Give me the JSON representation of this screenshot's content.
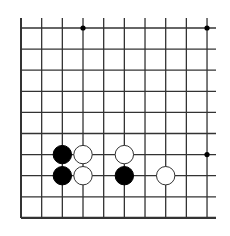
{
  "board": {
    "description": "Go board corner fragment (bottom-left edge visible, top and right open)",
    "columns": 10,
    "rows": 10,
    "origin_x": 21,
    "origin_y": 28,
    "spacing_x": 20.67,
    "spacing_y": 21.1,
    "line_color": "#333333",
    "edge_lines": [
      "left",
      "bottom"
    ],
    "star_points": [
      {
        "col": 3,
        "row": 0
      },
      {
        "col": 9,
        "row": 0
      },
      {
        "col": 9,
        "row": 6
      }
    ],
    "stones": [
      {
        "color": "black",
        "col": 2,
        "row": 6
      },
      {
        "color": "black",
        "col": 2,
        "row": 7
      },
      {
        "color": "white",
        "col": 3,
        "row": 6
      },
      {
        "color": "white",
        "col": 3,
        "row": 7
      },
      {
        "color": "white",
        "col": 5,
        "row": 6
      },
      {
        "color": "black",
        "col": 5,
        "row": 7
      },
      {
        "color": "white",
        "col": 7,
        "row": 7
      }
    ],
    "colors": {
      "black_stone": "#000000",
      "white_stone_fill": "#ffffff",
      "white_stone_stroke": "#333333",
      "background": "#ffffff"
    }
  }
}
